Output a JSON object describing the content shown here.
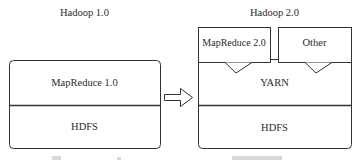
{
  "diagram": {
    "left": {
      "title": "Hadoop 1.0",
      "layers": [
        {
          "label": "MapReduce 1.0"
        },
        {
          "label": "HDFS"
        }
      ]
    },
    "right": {
      "title": "Hadoop 2.0",
      "top_modules": [
        {
          "label": "MapReduce 2.0"
        },
        {
          "label": "Other"
        }
      ],
      "layers": [
        {
          "label": "YARN"
        },
        {
          "label": "HDFS"
        }
      ]
    },
    "arrow": {
      "direction": "right",
      "meaning": "evolves-to"
    },
    "colors": {
      "stroke": "#333333",
      "background": "#ffffff",
      "text": "#2a2a2a"
    }
  }
}
